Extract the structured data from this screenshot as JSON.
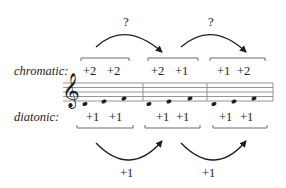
{
  "diagram": {
    "type": "music-interval-diagram",
    "question_marks": [
      "?",
      "?"
    ],
    "rows": {
      "chromatic": {
        "label": "chromatic:",
        "groups": [
          {
            "values": [
              "+2",
              "+2"
            ]
          },
          {
            "values": [
              "+2",
              "+1"
            ]
          },
          {
            "values": [
              "+1",
              "+2"
            ]
          }
        ]
      },
      "diatonic": {
        "label": "diatonic:",
        "groups": [
          {
            "values": [
              "+1",
              "+1"
            ]
          },
          {
            "values": [
              "+1",
              "+1"
            ]
          },
          {
            "values": [
              "+1",
              "+1"
            ]
          }
        ]
      }
    },
    "bottom_arrow_labels": [
      "+1",
      "+1"
    ],
    "staff": {
      "clef": "treble",
      "measures": 3,
      "notes_per_measure": 3,
      "clef_glyph": "𝄞"
    },
    "colors": {
      "ink": "#1e1e1e",
      "bracket": "#6a6a6a",
      "staff": "#8a8a8a",
      "background": "#ffffff"
    }
  }
}
